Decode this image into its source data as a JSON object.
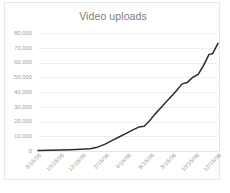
{
  "chart_data": {
    "type": "line",
    "title": "Video uploads",
    "xlabel": "",
    "ylabel": "",
    "ylim": [
      0,
      80000
    ],
    "ytick_values": [
      0,
      10000,
      20000,
      30000,
      40000,
      50000,
      60000,
      70000,
      80000
    ],
    "ytick_labels": [
      "0",
      "10,000",
      "20,000",
      "30,000",
      "40,000",
      "50,000",
      "60,000",
      "70,000",
      "80,000"
    ],
    "grid": true,
    "legend": false,
    "legend_position": "none",
    "line_color": "#2b2b2b",
    "categories": [
      "8/15/05",
      "9/15/05",
      "10/15/05",
      "11/15/05",
      "12/15/05",
      "1/15/06",
      "2/15/06",
      "3/15/06",
      "4/15/06",
      "5/15/06",
      "6/15/06",
      "7/15/06",
      "8/15/06",
      "9/15/06",
      "10/15/06",
      "11/15/06",
      "12/15/06"
    ],
    "xtick_labels": [
      "8/15/05",
      "10/15/05",
      "12/15/05",
      "2/15/06",
      "4/15/06",
      "6/15/06",
      "8/15/06",
      "10/15/06",
      "12/15/06"
    ],
    "series": [
      {
        "name": "Video uploads",
        "x": [
          0.0,
          0.06,
          0.12,
          0.18,
          0.24,
          0.29,
          0.33,
          0.37,
          0.41,
          0.45,
          0.49,
          0.53,
          0.56,
          0.59,
          0.62,
          0.65,
          0.68,
          0.71,
          0.74,
          0.77,
          0.8,
          0.83,
          0.86,
          0.89,
          0.92,
          0.95,
          0.97,
          1.0
        ],
        "values": [
          400,
          500,
          700,
          900,
          1200,
          1500,
          2600,
          4500,
          7000,
          9500,
          12000,
          14500,
          16200,
          16800,
          20500,
          25000,
          29000,
          33000,
          37000,
          41000,
          45500,
          46500,
          50000,
          52000,
          58000,
          65500,
          66000,
          73000
        ]
      }
    ]
  }
}
